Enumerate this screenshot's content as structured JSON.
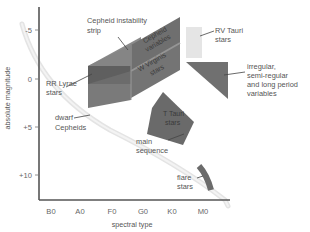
{
  "diagram": {
    "y_axis": {
      "label": "absolute magnitude",
      "ticks": [
        "-5",
        "0",
        "+5",
        "+10"
      ]
    },
    "x_axis": {
      "label": "spectral type",
      "ticks": [
        "B0",
        "A0",
        "F0",
        "G0",
        "K0",
        "M0"
      ]
    },
    "regions": {
      "cepheid_strip": {
        "label_line1": "Cepheid instability",
        "label_line2": "strip"
      },
      "cepheid_variables": {
        "line1": "Cepheid",
        "line2": "variables"
      },
      "w_virginis": {
        "line1": "W Virginis",
        "line2": "stars"
      },
      "rr_lyrae": {
        "line1": "RR Lyrae",
        "line2": "stars"
      },
      "dwarf_cepheids": {
        "line1": "dwarf",
        "line2": "Cepheids"
      },
      "rv_tauri": {
        "line1": "RV Tauri",
        "line2": "stars"
      },
      "irregular": {
        "line1": "irregular,",
        "line2": "semi-regular",
        "line3": "and long period",
        "line4": "variables"
      },
      "t_tauri": {
        "line1": "T Tauri",
        "line2": "stars"
      },
      "main_sequence": {
        "line1": "main",
        "line2": "sequence"
      },
      "flare_stars": {
        "line1": "flare",
        "line2": "stars"
      }
    },
    "colors": {
      "strip_top": "#7d7d7d",
      "strip_front": "#6e6e6e",
      "strip_dark": "#5e5e5e",
      "rv_tauri": "#e6e6e6",
      "irregular": "#707070",
      "t_tauri": "#6a6a6a",
      "main_sequence": "#e2e2e2",
      "axis": "#555555"
    }
  }
}
